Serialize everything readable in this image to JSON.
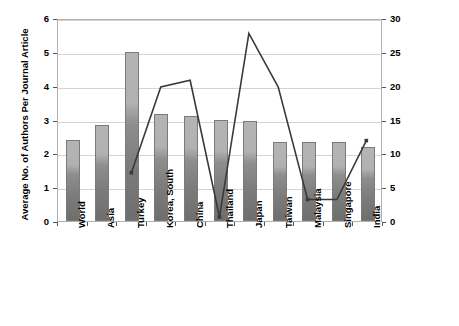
{
  "chart_data": {
    "type": "bar",
    "title": "",
    "subtitle": "",
    "xlabel": "",
    "ylabel": "Average No. of Authors Per Journal Article",
    "y2label": "Volume of RE Journal Publications per Country",
    "categories": [
      "World",
      "Asia",
      "Turkey",
      "Korea, South",
      "China",
      "Thailand",
      "Japan",
      "Taiwan",
      "Malaysia",
      "Singapore",
      "India"
    ],
    "ylim": [
      0,
      6
    ],
    "yticks": [
      "0",
      "1",
      "2",
      "3",
      "4",
      "5",
      "6"
    ],
    "y2lim": [
      0,
      30
    ],
    "y2ticks": [
      "0",
      "5",
      "10",
      "15",
      "20",
      "25",
      "30"
    ],
    "grid": true,
    "legend": "none",
    "series": [
      {
        "name": "Average No. of Authors Per Journal Article",
        "type": "bar",
        "axis": "left",
        "values": [
          2.4,
          2.85,
          5.0,
          3.15,
          3.1,
          3.0,
          2.95,
          2.35,
          2.35,
          2.35,
          2.2
        ]
      },
      {
        "name": "Volume of RE Journal Publications per Country",
        "type": "line",
        "axis": "right",
        "values": [
          null,
          null,
          7.2,
          20.0,
          21.0,
          0.6,
          28.0,
          20.0,
          3.2,
          3.2,
          12.0
        ]
      }
    ]
  },
  "axes": {
    "left_title": "Average No. of Authors Per Journal Article",
    "right_title": "Volume of RE Journal Publications per Country"
  }
}
